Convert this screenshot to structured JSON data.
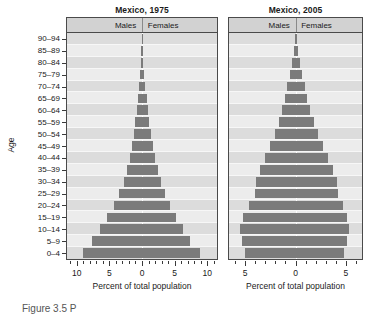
{
  "figure": {
    "caption": "Figure 3.5 P",
    "y_axis_label": "Age",
    "x_axis_label": "Percent of total population",
    "legend_male": "Males",
    "legend_female": "Females",
    "bar_color": "#7b7b7b",
    "panel_bg": "#e8e8e8",
    "strip_bg": "#d2d2d2"
  },
  "chart_data": {
    "type": "bar",
    "xlabel": "Percent of total population",
    "ylabel": "Age",
    "grid": true,
    "legend_position": "top-strip",
    "categories": [
      "0–4",
      "5–9",
      "10–14",
      "15–19",
      "20–24",
      "25–29",
      "30–34",
      "35–39",
      "40–44",
      "45–49",
      "50–54",
      "55–59",
      "60–64",
      "65–69",
      "70–74",
      "75–79",
      "80–84",
      "85–89",
      "90–94"
    ],
    "panels": [
      {
        "name": "Mexico, 1975",
        "title": "Mexico, 1975",
        "xlim": [
          -11.5,
          11.5
        ],
        "xticks_major": [
          10,
          5,
          0,
          5,
          10
        ],
        "xtick_labels": [
          "10",
          "5",
          "0",
          "5",
          "10"
        ],
        "series": [
          {
            "name": "Males",
            "values": [
              9.1,
              7.6,
              6.5,
              5.3,
              4.3,
              3.5,
              2.8,
              2.3,
              1.9,
              1.6,
              1.3,
              1.0,
              0.8,
              0.6,
              0.45,
              0.3,
              0.2,
              0.12,
              0.05
            ]
          },
          {
            "name": "Females",
            "values": [
              8.9,
              7.4,
              6.3,
              5.2,
              4.3,
              3.5,
              2.9,
              2.4,
              2.0,
              1.7,
              1.4,
              1.1,
              0.9,
              0.7,
              0.5,
              0.35,
              0.22,
              0.13,
              0.05
            ]
          }
        ]
      },
      {
        "name": "Mexico, 2005",
        "title": "Mexico, 2005",
        "xlim": [
          -6.6,
          6.6
        ],
        "xticks_major": [
          5,
          0,
          5
        ],
        "xtick_labels": [
          "5",
          "0",
          "5"
        ],
        "series": [
          {
            "name": "Males",
            "values": [
              5.0,
              5.3,
              5.5,
              5.2,
              4.6,
              4.0,
              3.9,
              3.5,
              3.0,
              2.5,
              2.0,
              1.6,
              1.3,
              1.0,
              0.8,
              0.55,
              0.35,
              0.2,
              0.08
            ]
          },
          {
            "name": "Females",
            "values": [
              4.8,
              5.1,
              5.3,
              5.1,
              4.7,
              4.2,
              4.1,
              3.7,
              3.2,
              2.7,
              2.2,
              1.8,
              1.4,
              1.1,
              0.9,
              0.65,
              0.42,
              0.25,
              0.1
            ]
          }
        ]
      }
    ]
  }
}
